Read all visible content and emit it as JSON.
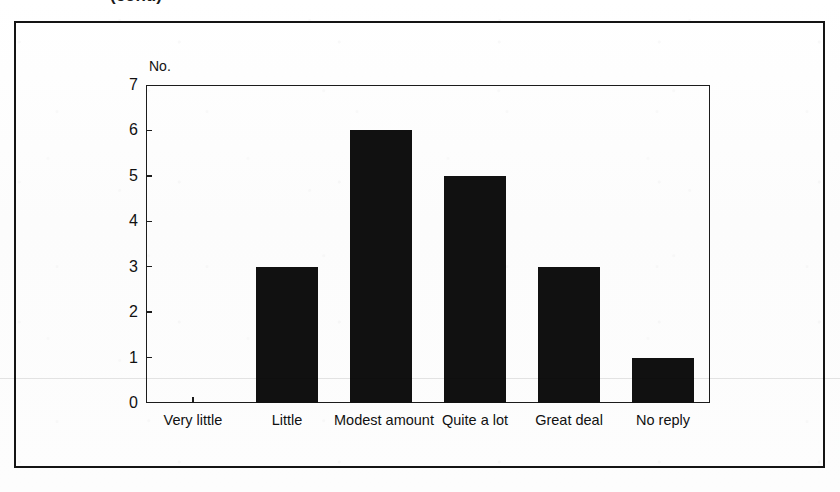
{
  "page": {
    "cropped_title": "(cont.)"
  },
  "chart_data": {
    "type": "bar",
    "title": "",
    "xlabel": "",
    "ylabel": "No.",
    "ylim": [
      0,
      7
    ],
    "grid": false,
    "legend": "none",
    "categories": [
      "Very little",
      "Little",
      "Modest amount",
      "Quite a lot",
      "Great deal",
      "No reply"
    ],
    "values": [
      0,
      3,
      6,
      5,
      3,
      1
    ],
    "y_ticks": [
      "0",
      "1",
      "2",
      "3",
      "4",
      "5",
      "6",
      "7"
    ],
    "bar_color": "#111111",
    "axis_color": "#1c1c1c",
    "frame_color": "#141414"
  }
}
